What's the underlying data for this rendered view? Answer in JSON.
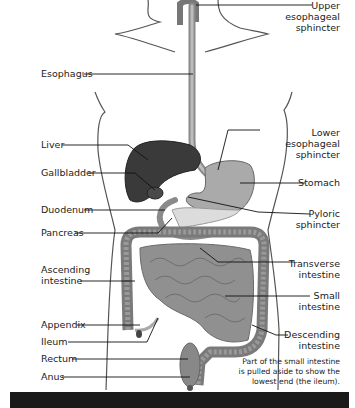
{
  "diagram": {
    "labels_left": [
      {
        "id": "esophagus",
        "text": "Esophagus"
      },
      {
        "id": "liver",
        "text": "Liver"
      },
      {
        "id": "gallbladder",
        "text": "Gallbladder"
      },
      {
        "id": "duodenum",
        "text": "Duodenum"
      },
      {
        "id": "pancreas",
        "text": "Pancreas"
      },
      {
        "id": "ascending",
        "line1": "Ascending",
        "line2": "intestine"
      },
      {
        "id": "appendix",
        "text": "Appendix"
      },
      {
        "id": "ileum",
        "text": "Ileum"
      },
      {
        "id": "rectum",
        "text": "Rectum"
      },
      {
        "id": "anus",
        "text": "Anus"
      }
    ],
    "labels_right": [
      {
        "id": "upper_sphincter",
        "line1": "Upper",
        "line2": "esophageal",
        "line3": "sphincter"
      },
      {
        "id": "lower_sphincter",
        "line1": "Lower",
        "line2": "esophageal",
        "line3": "sphincter"
      },
      {
        "id": "stomach",
        "text": "Stomach"
      },
      {
        "id": "pyloric",
        "line1": "Pyloric",
        "line2": "sphincter"
      },
      {
        "id": "transverse",
        "line1": "Transverse",
        "line2": "intestine"
      },
      {
        "id": "small",
        "line1": "Small",
        "line2": "intestine"
      },
      {
        "id": "descending",
        "line1": "Descending",
        "line2": "intestine"
      }
    ],
    "note": {
      "line1": "Part of the small intestine",
      "line2": "is pulled aside to show the",
      "line3": "lowest end (the ileum)."
    },
    "colors": {
      "liver": "#3a3a3a",
      "organ_gray": "#9a9a9a",
      "stomach": "#a8a8a8",
      "intestine": "#8c8c8c",
      "outline": "#555555",
      "leader": "#111111"
    }
  }
}
